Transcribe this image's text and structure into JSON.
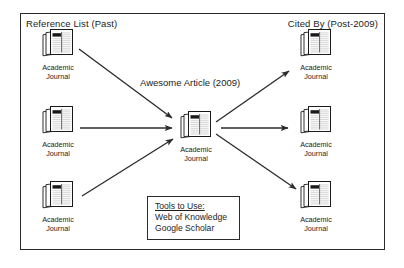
{
  "diagram": {
    "frame": {
      "stroke": "#2b2b2b"
    },
    "headers": {
      "left": "Reference List (Past)",
      "right": "Cited By (Post-2009)"
    },
    "center_label": "Awesome Article (2009)",
    "node_caption": "Academic\nJournal",
    "nodes": [
      {
        "id": "ref-1",
        "caption": "Academic\nJournal",
        "x": 30,
        "y": 28
      },
      {
        "id": "ref-2",
        "caption": "Academic\nJournal",
        "x": 30,
        "y": 105
      },
      {
        "id": "ref-3",
        "caption": "Academic\nJournal",
        "x": 30,
        "y": 180
      },
      {
        "id": "center",
        "caption": "Academic\nJournal",
        "x": 176,
        "y": 110
      },
      {
        "id": "cited-1",
        "caption": "Academic\nJournal",
        "x": 288,
        "y": 28
      },
      {
        "id": "cited-2",
        "caption": "Academic\nJournal",
        "x": 288,
        "y": 105
      },
      {
        "id": "cited-3",
        "caption": "Academic\nJournal",
        "x": 288,
        "y": 180
      }
    ],
    "arrows": [
      {
        "id": "ref1-to-center",
        "from": "ref-1",
        "to": "center"
      },
      {
        "id": "ref2-to-center",
        "from": "ref-2",
        "to": "center"
      },
      {
        "id": "ref3-to-center",
        "from": "ref-3",
        "to": "center"
      },
      {
        "id": "center-to-cited1",
        "from": "center",
        "to": "cited-1"
      },
      {
        "id": "center-to-cited2",
        "from": "center",
        "to": "cited-2"
      },
      {
        "id": "center-to-cited3",
        "from": "center",
        "to": "cited-3"
      }
    ],
    "tools": {
      "title": "Tools to Use:",
      "items": [
        "Web of Knowledge",
        "Google Scholar"
      ]
    },
    "colors": {
      "ink": "#1c1c1c",
      "line": "#2b2b2b",
      "paper": "#ffffff",
      "icon_fill": "#d8d8d8",
      "icon_dark": "#1a1a1a"
    }
  }
}
